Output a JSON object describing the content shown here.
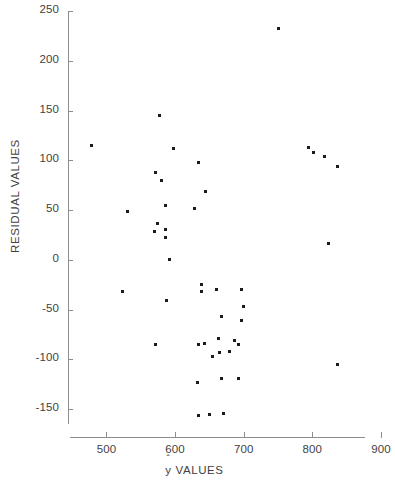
{
  "chart_data": {
    "type": "scatter",
    "title": "",
    "xlabel": "ŷ VALUES",
    "xlabel_base": "y",
    "xlabel_accent": "ˆ",
    "xlabel_suffix": " VALUES",
    "ylabel": "RESIDUAL VALUES",
    "xlim": [
      444,
      900
    ],
    "ylim": [
      -178,
      250
    ],
    "xticks": [
      500,
      600,
      700,
      800,
      900
    ],
    "xtick_labels": [
      "500",
      "600",
      "700",
      "800",
      "900"
    ],
    "yticks": [
      -150,
      -100,
      -50,
      0,
      50,
      100,
      150,
      200,
      250
    ],
    "ytick_labels": [
      "-150",
      "-100",
      "-50",
      "0",
      "50",
      "100",
      "150",
      "200",
      "250"
    ],
    "grid": false,
    "legend": null,
    "marker": "square-dot",
    "marker_color": "#1c1c1c",
    "axis_color": "#8d8d8d",
    "background": "#ffffff",
    "points": [
      {
        "x": 478,
        "y": 115
      },
      {
        "x": 750,
        "y": 232
      },
      {
        "x": 578,
        "y": 145
      },
      {
        "x": 794,
        "y": 113
      },
      {
        "x": 802,
        "y": 108
      },
      {
        "x": 818,
        "y": 104
      },
      {
        "x": 836,
        "y": 94
      },
      {
        "x": 597,
        "y": 112
      },
      {
        "x": 634,
        "y": 98
      },
      {
        "x": 571,
        "y": 88
      },
      {
        "x": 580,
        "y": 80
      },
      {
        "x": 645,
        "y": 69
      },
      {
        "x": 586,
        "y": 55
      },
      {
        "x": 629,
        "y": 52
      },
      {
        "x": 531,
        "y": 49
      },
      {
        "x": 574,
        "y": 37
      },
      {
        "x": 570,
        "y": 28
      },
      {
        "x": 586,
        "y": 30
      },
      {
        "x": 586,
        "y": 22
      },
      {
        "x": 823,
        "y": 16
      },
      {
        "x": 592,
        "y": 0
      },
      {
        "x": 524,
        "y": -32
      },
      {
        "x": 639,
        "y": -25
      },
      {
        "x": 639,
        "y": -32
      },
      {
        "x": 660,
        "y": -30
      },
      {
        "x": 697,
        "y": -30
      },
      {
        "x": 587,
        "y": -41
      },
      {
        "x": 700,
        "y": -47
      },
      {
        "x": 668,
        "y": -57
      },
      {
        "x": 697,
        "y": -61
      },
      {
        "x": 572,
        "y": -85
      },
      {
        "x": 634,
        "y": -85
      },
      {
        "x": 643,
        "y": -84
      },
      {
        "x": 663,
        "y": -79
      },
      {
        "x": 686,
        "y": -81
      },
      {
        "x": 692,
        "y": -85
      },
      {
        "x": 664,
        "y": -93
      },
      {
        "x": 655,
        "y": -97
      },
      {
        "x": 679,
        "y": -92
      },
      {
        "x": 836,
        "y": -105
      },
      {
        "x": 632,
        "y": -123
      },
      {
        "x": 667,
        "y": -119
      },
      {
        "x": 693,
        "y": -119
      },
      {
        "x": 634,
        "y": -156
      },
      {
        "x": 650,
        "y": -155
      },
      {
        "x": 671,
        "y": -154
      }
    ]
  }
}
